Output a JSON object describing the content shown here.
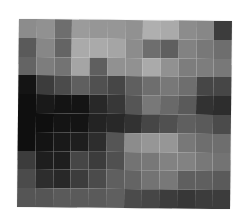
{
  "image": {
    "description": "Pixelated grayscale mosaic image",
    "grid": {
      "columns": 12,
      "rows": 10
    },
    "gray_values": [
      [
        140,
        145,
        110,
        155,
        150,
        150,
        145,
        175,
        170,
        140,
        135,
        60
      ],
      [
        90,
        135,
        100,
        170,
        170,
        165,
        140,
        110,
        95,
        130,
        120,
        110
      ],
      [
        100,
        125,
        115,
        165,
        95,
        145,
        145,
        170,
        145,
        125,
        125,
        120
      ],
      [
        20,
        60,
        75,
        95,
        80,
        70,
        95,
        110,
        120,
        110,
        70,
        70
      ],
      [
        15,
        25,
        20,
        20,
        40,
        55,
        85,
        120,
        105,
        90,
        50,
        45
      ],
      [
        15,
        15,
        20,
        20,
        35,
        40,
        50,
        70,
        80,
        95,
        90,
        75
      ],
      [
        15,
        20,
        25,
        30,
        45,
        85,
        140,
        150,
        150,
        120,
        110,
        110
      ],
      [
        60,
        30,
        30,
        70,
        60,
        80,
        115,
        120,
        130,
        130,
        120,
        115
      ],
      [
        75,
        45,
        40,
        60,
        75,
        95,
        100,
        115,
        120,
        95,
        95,
        90
      ],
      [
        85,
        85,
        90,
        90,
        90,
        95,
        75,
        70,
        60,
        55,
        60,
        60
      ]
    ]
  }
}
